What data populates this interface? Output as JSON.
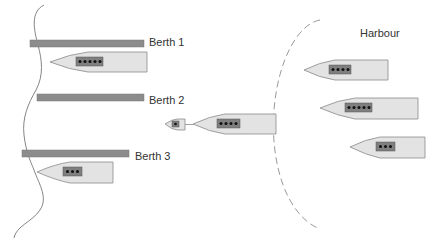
{
  "diagram": {
    "colors": {
      "berth_bar": "#8c8c8c",
      "hull_fill": "#e3e3e3",
      "hull_stroke": "#8a8a8a",
      "cabin_fill": "#7f7f7f",
      "dot": "#111111",
      "coastline": "#777777",
      "harbour_boundary": "#999999"
    },
    "harbour_label": "Harbour",
    "berths": [
      {
        "label": "Berth 1",
        "ship_containers": 5
      },
      {
        "label": "Berth 2",
        "ship_containers": 0
      },
      {
        "label": "Berth 3",
        "ship_containers": 3
      }
    ],
    "approaching_ship": {
      "containers": 4,
      "tug_containers": 1
    },
    "waiting_ships": [
      {
        "containers": 4
      },
      {
        "containers": 5
      },
      {
        "containers": 3
      }
    ]
  }
}
